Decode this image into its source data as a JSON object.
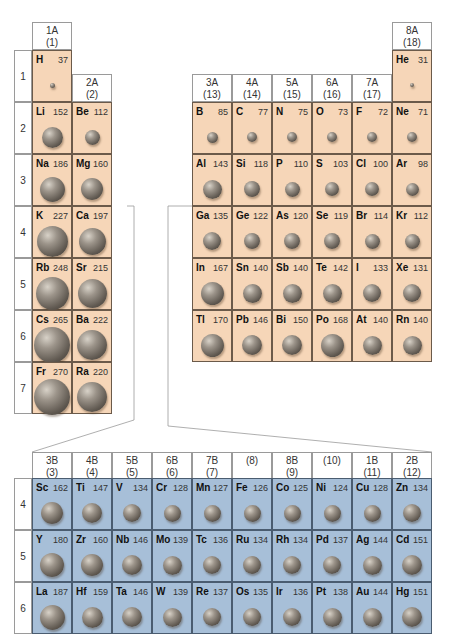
{
  "figure": {
    "unit": "pm"
  },
  "main_groups": {
    "headers": [
      {
        "label": "1A",
        "number": "(1)"
      },
      {
        "label": "2A",
        "number": "(2)"
      },
      {
        "label": "3A",
        "number": "(13)"
      },
      {
        "label": "4A",
        "number": "(14)"
      },
      {
        "label": "5A",
        "number": "(15)"
      },
      {
        "label": "6A",
        "number": "(16)"
      },
      {
        "label": "7A",
        "number": "(17)"
      },
      {
        "label": "8A",
        "number": "(18)"
      }
    ],
    "period_labels": [
      "1",
      "2",
      "3",
      "4",
      "5",
      "6",
      "7"
    ]
  },
  "transition": {
    "headers": [
      {
        "label": "3B",
        "number": "(3)"
      },
      {
        "label": "4B",
        "number": "(4)"
      },
      {
        "label": "5B",
        "number": "(5)"
      },
      {
        "label": "6B",
        "number": "(6)"
      },
      {
        "label": "7B",
        "number": "(7)"
      },
      {
        "label": "",
        "number": "(8)"
      },
      {
        "label": "8B",
        "number": "(9)"
      },
      {
        "label": "",
        "number": "(10)"
      },
      {
        "label": "1B",
        "number": "(11)"
      },
      {
        "label": "2B",
        "number": "(12)"
      }
    ],
    "period_labels": [
      "4",
      "5",
      "6"
    ]
  },
  "chart_data": {
    "type": "table",
    "main_group_elements": [
      {
        "symbol": "H",
        "radius": 37,
        "group": "1A",
        "period": 1
      },
      {
        "symbol": "He",
        "radius": 31,
        "group": "8A",
        "period": 1
      },
      {
        "symbol": "Li",
        "radius": 152,
        "group": "1A",
        "period": 2
      },
      {
        "symbol": "Be",
        "radius": 112,
        "group": "2A",
        "period": 2
      },
      {
        "symbol": "B",
        "radius": 85,
        "group": "3A",
        "period": 2
      },
      {
        "symbol": "C",
        "radius": 77,
        "group": "4A",
        "period": 2
      },
      {
        "symbol": "N",
        "radius": 75,
        "group": "5A",
        "period": 2
      },
      {
        "symbol": "O",
        "radius": 73,
        "group": "6A",
        "period": 2
      },
      {
        "symbol": "F",
        "radius": 72,
        "group": "7A",
        "period": 2
      },
      {
        "symbol": "Ne",
        "radius": 71,
        "group": "8A",
        "period": 2
      },
      {
        "symbol": "Na",
        "radius": 186,
        "group": "1A",
        "period": 3
      },
      {
        "symbol": "Mg",
        "radius": 160,
        "group": "2A",
        "period": 3
      },
      {
        "symbol": "Al",
        "radius": 143,
        "group": "3A",
        "period": 3
      },
      {
        "symbol": "Si",
        "radius": 118,
        "group": "4A",
        "period": 3
      },
      {
        "symbol": "P",
        "radius": 110,
        "group": "5A",
        "period": 3
      },
      {
        "symbol": "S",
        "radius": 103,
        "group": "6A",
        "period": 3
      },
      {
        "symbol": "Cl",
        "radius": 100,
        "group": "7A",
        "period": 3
      },
      {
        "symbol": "Ar",
        "radius": 98,
        "group": "8A",
        "period": 3
      },
      {
        "symbol": "K",
        "radius": 227,
        "group": "1A",
        "period": 4
      },
      {
        "symbol": "Ca",
        "radius": 197,
        "group": "2A",
        "period": 4
      },
      {
        "symbol": "Ga",
        "radius": 135,
        "group": "3A",
        "period": 4
      },
      {
        "symbol": "Ge",
        "radius": 122,
        "group": "4A",
        "period": 4
      },
      {
        "symbol": "As",
        "radius": 120,
        "group": "5A",
        "period": 4
      },
      {
        "symbol": "Se",
        "radius": 119,
        "group": "6A",
        "period": 4
      },
      {
        "symbol": "Br",
        "radius": 114,
        "group": "7A",
        "period": 4
      },
      {
        "symbol": "Kr",
        "radius": 112,
        "group": "8A",
        "period": 4
      },
      {
        "symbol": "Rb",
        "radius": 248,
        "group": "1A",
        "period": 5
      },
      {
        "symbol": "Sr",
        "radius": 215,
        "group": "2A",
        "period": 5
      },
      {
        "symbol": "In",
        "radius": 167,
        "group": "3A",
        "period": 5
      },
      {
        "symbol": "Sn",
        "radius": 140,
        "group": "4A",
        "period": 5
      },
      {
        "symbol": "Sb",
        "radius": 140,
        "group": "5A",
        "period": 5
      },
      {
        "symbol": "Te",
        "radius": 142,
        "group": "6A",
        "period": 5
      },
      {
        "symbol": "I",
        "radius": 133,
        "group": "7A",
        "period": 5
      },
      {
        "symbol": "Xe",
        "radius": 131,
        "group": "8A",
        "period": 5
      },
      {
        "symbol": "Cs",
        "radius": 265,
        "group": "1A",
        "period": 6
      },
      {
        "symbol": "Ba",
        "radius": 222,
        "group": "2A",
        "period": 6
      },
      {
        "symbol": "Tl",
        "radius": 170,
        "group": "3A",
        "period": 6
      },
      {
        "symbol": "Pb",
        "radius": 146,
        "group": "4A",
        "period": 6
      },
      {
        "symbol": "Bi",
        "radius": 150,
        "group": "5A",
        "period": 6
      },
      {
        "symbol": "Po",
        "radius": 168,
        "group": "6A",
        "period": 6
      },
      {
        "symbol": "At",
        "radius": 140,
        "group": "7A",
        "period": 6
      },
      {
        "symbol": "Rn",
        "radius": 140,
        "group": "8A",
        "period": 6
      },
      {
        "symbol": "Fr",
        "radius": 270,
        "group": "1A",
        "period": 7
      },
      {
        "symbol": "Ra",
        "radius": 220,
        "group": "2A",
        "period": 7
      }
    ],
    "transition_elements": [
      {
        "symbol": "Sc",
        "radius": 162,
        "group": "3B",
        "period": 4
      },
      {
        "symbol": "Ti",
        "radius": 147,
        "group": "4B",
        "period": 4
      },
      {
        "symbol": "V",
        "radius": 134,
        "group": "5B",
        "period": 4
      },
      {
        "symbol": "Cr",
        "radius": 128,
        "group": "6B",
        "period": 4
      },
      {
        "symbol": "Mn",
        "radius": 127,
        "group": "7B",
        "period": 4
      },
      {
        "symbol": "Fe",
        "radius": 126,
        "group": "8B(8)",
        "period": 4
      },
      {
        "symbol": "Co",
        "radius": 125,
        "group": "8B(9)",
        "period": 4
      },
      {
        "symbol": "Ni",
        "radius": 124,
        "group": "8B(10)",
        "period": 4
      },
      {
        "symbol": "Cu",
        "radius": 128,
        "group": "1B",
        "period": 4
      },
      {
        "symbol": "Zn",
        "radius": 134,
        "group": "2B",
        "period": 4
      },
      {
        "symbol": "Y",
        "radius": 180,
        "group": "3B",
        "period": 5
      },
      {
        "symbol": "Zr",
        "radius": 160,
        "group": "4B",
        "period": 5
      },
      {
        "symbol": "Nb",
        "radius": 146,
        "group": "5B",
        "period": 5
      },
      {
        "symbol": "Mo",
        "radius": 139,
        "group": "6B",
        "period": 5
      },
      {
        "symbol": "Tc",
        "radius": 136,
        "group": "7B",
        "period": 5
      },
      {
        "symbol": "Ru",
        "radius": 134,
        "group": "8B(8)",
        "period": 5
      },
      {
        "symbol": "Rh",
        "radius": 134,
        "group": "8B(9)",
        "period": 5
      },
      {
        "symbol": "Pd",
        "radius": 137,
        "group": "8B(10)",
        "period": 5
      },
      {
        "symbol": "Ag",
        "radius": 144,
        "group": "1B",
        "period": 5
      },
      {
        "symbol": "Cd",
        "radius": 151,
        "group": "2B",
        "period": 5
      },
      {
        "symbol": "La",
        "radius": 187,
        "group": "3B",
        "period": 6
      },
      {
        "symbol": "Hf",
        "radius": 159,
        "group": "4B",
        "period": 6
      },
      {
        "symbol": "Ta",
        "radius": 146,
        "group": "5B",
        "period": 6
      },
      {
        "symbol": "W",
        "radius": 139,
        "group": "6B",
        "period": 6
      },
      {
        "symbol": "Re",
        "radius": 137,
        "group": "7B",
        "period": 6
      },
      {
        "symbol": "Os",
        "radius": 135,
        "group": "8B(8)",
        "period": 6
      },
      {
        "symbol": "Ir",
        "radius": 136,
        "group": "8B(9)",
        "period": 6
      },
      {
        "symbol": "Pt",
        "radius": 138,
        "group": "8B(10)",
        "period": 6
      },
      {
        "symbol": "Au",
        "radius": 144,
        "group": "1B",
        "period": 6
      },
      {
        "symbol": "Hg",
        "radius": 151,
        "group": "2B",
        "period": 6
      }
    ]
  },
  "colors": {
    "main_group_cell": "#f6d6b8",
    "transition_cell": "#a7bfd8",
    "sphere": "#6e665d"
  }
}
